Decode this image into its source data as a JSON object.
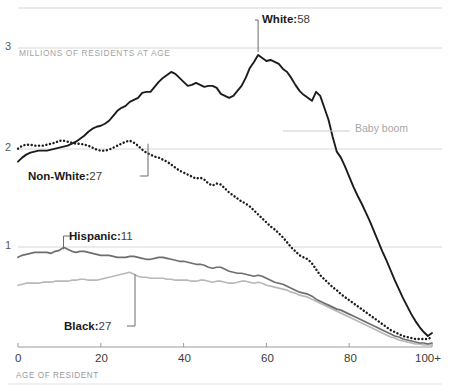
{
  "chart_data": {
    "type": "line",
    "title": "",
    "subtitle": "",
    "xlabel": "AGE OF RESIDENT",
    "ylabel": "MILLIONS OF RESIDENTS AT AGE",
    "xlim": [
      0,
      100
    ],
    "ylim": [
      0,
      3.25
    ],
    "xticks": [
      0,
      20,
      40,
      60,
      80,
      100
    ],
    "xtick_labels": [
      "0",
      "20",
      "40",
      "60",
      "80",
      "100+"
    ],
    "yticks": [
      1,
      2,
      3
    ],
    "ytick_labels": [
      "1",
      "2",
      "3"
    ],
    "grid": "horizontal",
    "legend": "inline-annotations",
    "x": [
      0,
      1,
      2,
      3,
      4,
      5,
      6,
      7,
      8,
      9,
      10,
      11,
      12,
      13,
      14,
      15,
      16,
      17,
      18,
      19,
      20,
      21,
      22,
      23,
      24,
      25,
      26,
      27,
      28,
      29,
      30,
      31,
      32,
      33,
      34,
      35,
      36,
      37,
      38,
      39,
      40,
      41,
      42,
      43,
      44,
      45,
      46,
      47,
      48,
      49,
      50,
      51,
      52,
      53,
      54,
      55,
      56,
      57,
      58,
      59,
      60,
      61,
      62,
      63,
      64,
      65,
      66,
      67,
      68,
      69,
      70,
      71,
      72,
      73,
      74,
      75,
      76,
      77,
      78,
      79,
      80,
      81,
      82,
      83,
      84,
      85,
      86,
      87,
      88,
      89,
      90,
      91,
      92,
      93,
      94,
      95,
      96,
      97,
      98,
      99,
      100
    ],
    "series": [
      {
        "name": "White",
        "style": "solid",
        "color": "#1c1c1c",
        "peak_age": 58,
        "annotation": "White: 58",
        "values": [
          1.86,
          1.9,
          1.93,
          1.95,
          1.96,
          1.97,
          1.97,
          1.97,
          1.98,
          1.99,
          2.0,
          2.01,
          2.02,
          2.04,
          2.06,
          2.09,
          2.12,
          2.16,
          2.19,
          2.21,
          2.22,
          2.24,
          2.27,
          2.32,
          2.37,
          2.4,
          2.42,
          2.46,
          2.48,
          2.5,
          2.55,
          2.56,
          2.56,
          2.61,
          2.66,
          2.7,
          2.73,
          2.76,
          2.74,
          2.7,
          2.66,
          2.62,
          2.63,
          2.65,
          2.63,
          2.61,
          2.62,
          2.62,
          2.6,
          2.54,
          2.52,
          2.5,
          2.52,
          2.57,
          2.62,
          2.7,
          2.8,
          2.86,
          2.93,
          2.9,
          2.87,
          2.88,
          2.86,
          2.84,
          2.79,
          2.76,
          2.7,
          2.63,
          2.57,
          2.53,
          2.5,
          2.47,
          2.56,
          2.52,
          2.4,
          2.28,
          2.11,
          1.96,
          1.9,
          1.81,
          1.71,
          1.61,
          1.52,
          1.44,
          1.35,
          1.26,
          1.16,
          1.06,
          0.96,
          0.87,
          0.77,
          0.67,
          0.58,
          0.49,
          0.41,
          0.33,
          0.26,
          0.2,
          0.15,
          0.11,
          0.14
        ]
      },
      {
        "name": "Non-White",
        "style": "dotted",
        "color": "#1c1c1c",
        "peak_age": 27,
        "annotation": "Non-White: 27",
        "values": [
          1.99,
          2.02,
          2.03,
          2.03,
          2.02,
          2.02,
          2.02,
          2.03,
          2.04,
          2.05,
          2.07,
          2.07,
          2.06,
          2.05,
          2.04,
          2.04,
          2.03,
          2.02,
          2.0,
          1.98,
          1.97,
          1.97,
          1.98,
          2.0,
          2.02,
          2.04,
          2.06,
          2.07,
          2.05,
          2.02,
          1.98,
          1.95,
          1.93,
          1.91,
          1.9,
          1.88,
          1.86,
          1.83,
          1.8,
          1.77,
          1.75,
          1.73,
          1.71,
          1.69,
          1.7,
          1.68,
          1.64,
          1.62,
          1.64,
          1.63,
          1.59,
          1.55,
          1.52,
          1.49,
          1.46,
          1.44,
          1.41,
          1.37,
          1.33,
          1.29,
          1.25,
          1.21,
          1.18,
          1.14,
          1.1,
          1.05,
          1.0,
          0.96,
          0.92,
          0.9,
          0.88,
          0.84,
          0.78,
          0.72,
          0.68,
          0.64,
          0.6,
          0.57,
          0.53,
          0.5,
          0.47,
          0.44,
          0.41,
          0.38,
          0.35,
          0.32,
          0.29,
          0.26,
          0.23,
          0.2,
          0.17,
          0.15,
          0.13,
          0.11,
          0.1,
          0.09,
          0.08,
          0.08,
          0.08,
          0.08,
          0.1
        ]
      },
      {
        "name": "Hispanic",
        "style": "solid",
        "color": "#6e6e6e",
        "peak_age": 11,
        "annotation": "Hispanic: 11",
        "values": [
          0.9,
          0.92,
          0.93,
          0.94,
          0.95,
          0.95,
          0.95,
          0.95,
          0.94,
          0.96,
          0.97,
          1.0,
          0.98,
          0.96,
          0.95,
          0.96,
          0.96,
          0.95,
          0.94,
          0.93,
          0.92,
          0.92,
          0.92,
          0.91,
          0.9,
          0.9,
          0.9,
          0.91,
          0.91,
          0.9,
          0.89,
          0.88,
          0.88,
          0.89,
          0.9,
          0.9,
          0.89,
          0.88,
          0.87,
          0.86,
          0.86,
          0.85,
          0.84,
          0.83,
          0.83,
          0.82,
          0.8,
          0.79,
          0.8,
          0.8,
          0.78,
          0.76,
          0.75,
          0.74,
          0.74,
          0.73,
          0.72,
          0.71,
          0.72,
          0.71,
          0.69,
          0.67,
          0.65,
          0.64,
          0.63,
          0.61,
          0.59,
          0.57,
          0.55,
          0.54,
          0.53,
          0.51,
          0.48,
          0.46,
          0.44,
          0.42,
          0.4,
          0.38,
          0.37,
          0.35,
          0.33,
          0.31,
          0.29,
          0.27,
          0.25,
          0.23,
          0.21,
          0.19,
          0.17,
          0.15,
          0.13,
          0.11,
          0.1,
          0.08,
          0.07,
          0.06,
          0.05,
          0.04,
          0.04,
          0.03,
          0.04
        ]
      },
      {
        "name": "Black",
        "style": "solid",
        "color": "#b8b8b8",
        "peak_age": 27,
        "annotation": "Black: 27",
        "values": [
          0.62,
          0.63,
          0.64,
          0.64,
          0.64,
          0.64,
          0.65,
          0.65,
          0.65,
          0.66,
          0.66,
          0.66,
          0.66,
          0.67,
          0.67,
          0.68,
          0.68,
          0.67,
          0.67,
          0.67,
          0.68,
          0.69,
          0.7,
          0.71,
          0.72,
          0.73,
          0.74,
          0.75,
          0.73,
          0.71,
          0.7,
          0.7,
          0.69,
          0.69,
          0.69,
          0.69,
          0.68,
          0.68,
          0.67,
          0.67,
          0.67,
          0.67,
          0.66,
          0.66,
          0.67,
          0.67,
          0.66,
          0.65,
          0.66,
          0.66,
          0.65,
          0.64,
          0.64,
          0.65,
          0.66,
          0.66,
          0.65,
          0.64,
          0.65,
          0.64,
          0.62,
          0.61,
          0.6,
          0.59,
          0.58,
          0.57,
          0.55,
          0.54,
          0.52,
          0.51,
          0.5,
          0.48,
          0.46,
          0.44,
          0.42,
          0.4,
          0.38,
          0.36,
          0.34,
          0.32,
          0.3,
          0.28,
          0.26,
          0.24,
          0.22,
          0.2,
          0.18,
          0.16,
          0.14,
          0.12,
          0.1,
          0.09,
          0.07,
          0.06,
          0.05,
          0.04,
          0.03,
          0.03,
          0.02,
          0.02,
          0.02
        ]
      }
    ],
    "annotations": [
      {
        "id": "white",
        "label": "White:",
        "value": "58",
        "x_age": 58
      },
      {
        "id": "non-white",
        "label": "Non-White:",
        "value": "27",
        "x_age": 27
      },
      {
        "id": "hispanic",
        "label": "Hispanic:",
        "value": "11",
        "x_age": 11
      },
      {
        "id": "black",
        "label": "Black:",
        "value": "27",
        "x_age": 27
      },
      {
        "id": "baby-boom",
        "label": "Baby boom",
        "value": "",
        "x_age": 67
      }
    ]
  },
  "axes": {
    "y_caption": "MILLIONS OF RESIDENTS AT AGE",
    "x_caption": "AGE OF RESIDENT",
    "y_tick_3": "3",
    "y_tick_2": "2",
    "y_tick_1": "1",
    "x_tick_0": "0",
    "x_tick_20": "20",
    "x_tick_40": "40",
    "x_tick_60": "60",
    "x_tick_80": "80",
    "x_tick_100": "100+"
  },
  "annotations": {
    "white_label": "White:",
    "white_value": "58",
    "nonwhite_label": "Non-White:",
    "nonwhite_value": "27",
    "hispanic_label": "Hispanic:",
    "hispanic_value": "11",
    "black_label": "Black:",
    "black_value": "27",
    "babyboom_label": "Baby boom"
  },
  "colors": {
    "white_line": "#1c1c1c",
    "nonwhite_line": "#1c1c1c",
    "hispanic_line": "#6e6e6e",
    "black_line": "#b8b8b8",
    "gridline": "#d8d8d8",
    "caption": "#a3a3a3"
  }
}
